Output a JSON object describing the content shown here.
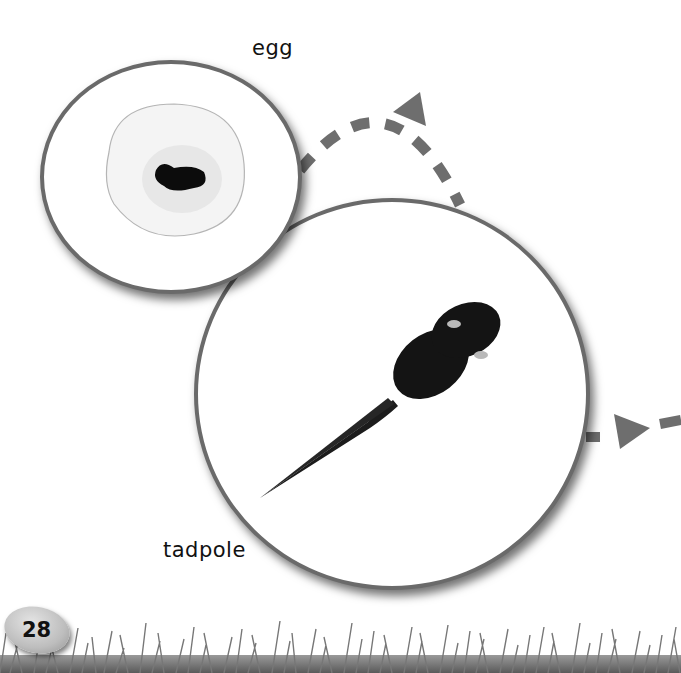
{
  "page": {
    "number": "28",
    "background": "#ffffff"
  },
  "lifecycle": {
    "stages": [
      {
        "id": "egg",
        "label": "egg"
      },
      {
        "id": "tadpole",
        "label": "tadpole"
      }
    ],
    "arrows": [
      {
        "from": "egg",
        "to": "tadpole",
        "style": "dashed-curved"
      },
      {
        "from": "tadpole",
        "to": "next-stage-offpage",
        "style": "dashed-straight"
      }
    ]
  },
  "colors": {
    "circle_border": "#6a6a6a",
    "arrow": "#6e6e6e",
    "label_text": "#111111",
    "grass": "#7a7a7a"
  }
}
